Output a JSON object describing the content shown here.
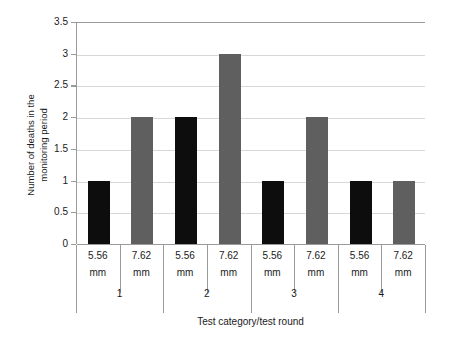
{
  "chart_data": {
    "type": "bar",
    "title": "",
    "xlabel": "Test category/test round",
    "ylabel_line1": "Number of deaths in the",
    "ylabel_line2": "monitoring period",
    "ylabel": "Number of deaths in the monitoring period",
    "ylim": [
      0,
      3.5
    ],
    "ytick_labels": [
      "0",
      "0.5",
      "1",
      "1.5",
      "2",
      "2.5",
      "3",
      "3.5"
    ],
    "ytick_values": [
      0,
      0.5,
      1,
      1.5,
      2,
      2.5,
      3,
      3.5
    ],
    "grid": true,
    "legend": "none",
    "categories": [
      "1",
      "2",
      "3",
      "4"
    ],
    "group_labels": [
      "5.56 mm",
      "7.62 mm"
    ],
    "series": [
      {
        "name": "5.56 mm",
        "color": "#0d0d0d",
        "values": [
          1,
          2,
          1,
          1
        ]
      },
      {
        "name": "7.62 mm",
        "color": "#5f5f5f",
        "values": [
          2,
          3,
          2,
          1
        ]
      }
    ],
    "bars": [
      {
        "round": "1",
        "caliber_line1": "5.56",
        "caliber_line2": "mm",
        "value": 1,
        "color": "black"
      },
      {
        "round": "1",
        "caliber_line1": "7.62",
        "caliber_line2": "mm",
        "value": 2,
        "color": "gray"
      },
      {
        "round": "2",
        "caliber_line1": "5.56",
        "caliber_line2": "mm",
        "value": 2,
        "color": "black"
      },
      {
        "round": "2",
        "caliber_line1": "7.62",
        "caliber_line2": "mm",
        "value": 3,
        "color": "gray"
      },
      {
        "round": "3",
        "caliber_line1": "5.56",
        "caliber_line2": "mm",
        "value": 1,
        "color": "black"
      },
      {
        "round": "3",
        "caliber_line1": "7.62",
        "caliber_line2": "mm",
        "value": 2,
        "color": "gray"
      },
      {
        "round": "4",
        "caliber_line1": "5.56",
        "caliber_line2": "mm",
        "value": 1,
        "color": "black"
      },
      {
        "round": "4",
        "caliber_line1": "7.62",
        "caliber_line2": "mm",
        "value": 1,
        "color": "gray"
      }
    ],
    "colors": {
      "bar_5_56": "#0d0d0d",
      "bar_7_62": "#5f5f5f",
      "gridline": "#d8d8d8",
      "axis": "#9a9a9a",
      "background": "#ffffff",
      "text": "#1a1a1a"
    }
  }
}
